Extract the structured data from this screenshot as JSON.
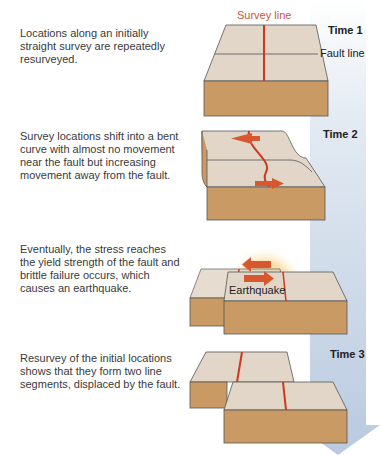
{
  "steps": [
    {
      "time": "Time 1",
      "description": "Locations along an initially straight survey are repeatedly resurveyed."
    },
    {
      "time": "Time 2",
      "description": "Survey locations shift into a bent curve with almost no movement near the fault but increasing movement away from the fault."
    },
    {
      "time": "",
      "description": "Eventually, the stress reaches the yield strength of the fault and brittle failure occurs, which causes an earthquake."
    },
    {
      "time": "Time 3",
      "description": "Resurvey of the initial locations shows that they form two line segments, displaced by the fault."
    }
  ],
  "labels": {
    "survey_line": "Survey line",
    "fault_line": "Fault line",
    "earthquake": "Earthquake"
  },
  "colors": {
    "block_top": "#e2d6c8",
    "block_side": "#c99a64",
    "survey_line": "#cc3a1e",
    "arrow": "#d9572e",
    "time_arrow": "#c9d6e6",
    "burst": "#f3c257"
  }
}
